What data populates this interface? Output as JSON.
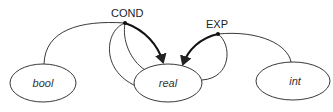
{
  "diagram": {
    "type": "type-coercion graph",
    "operators": [
      {
        "id": "cond",
        "label": "COND"
      },
      {
        "id": "exp",
        "label": "EXP"
      }
    ],
    "nodes": [
      {
        "id": "bool",
        "label": "bool"
      },
      {
        "id": "real",
        "label": "real"
      },
      {
        "id": "int",
        "label": "int"
      }
    ],
    "edges": [
      {
        "from": "cond",
        "to": "bool",
        "style": "thin"
      },
      {
        "from": "cond",
        "to": "real",
        "style": "thin",
        "note": "outer loop"
      },
      {
        "from": "cond",
        "to": "real",
        "style": "thin",
        "note": "inner"
      },
      {
        "from": "cond",
        "to": "real",
        "style": "bold",
        "arrow": true
      },
      {
        "from": "exp",
        "to": "real",
        "style": "bold",
        "arrow": true
      },
      {
        "from": "exp",
        "to": "real",
        "style": "thin",
        "note": "loop"
      },
      {
        "from": "exp",
        "to": "int",
        "style": "thin"
      }
    ],
    "colors": {
      "stroke": "#222222",
      "background": "#ffffff"
    }
  }
}
